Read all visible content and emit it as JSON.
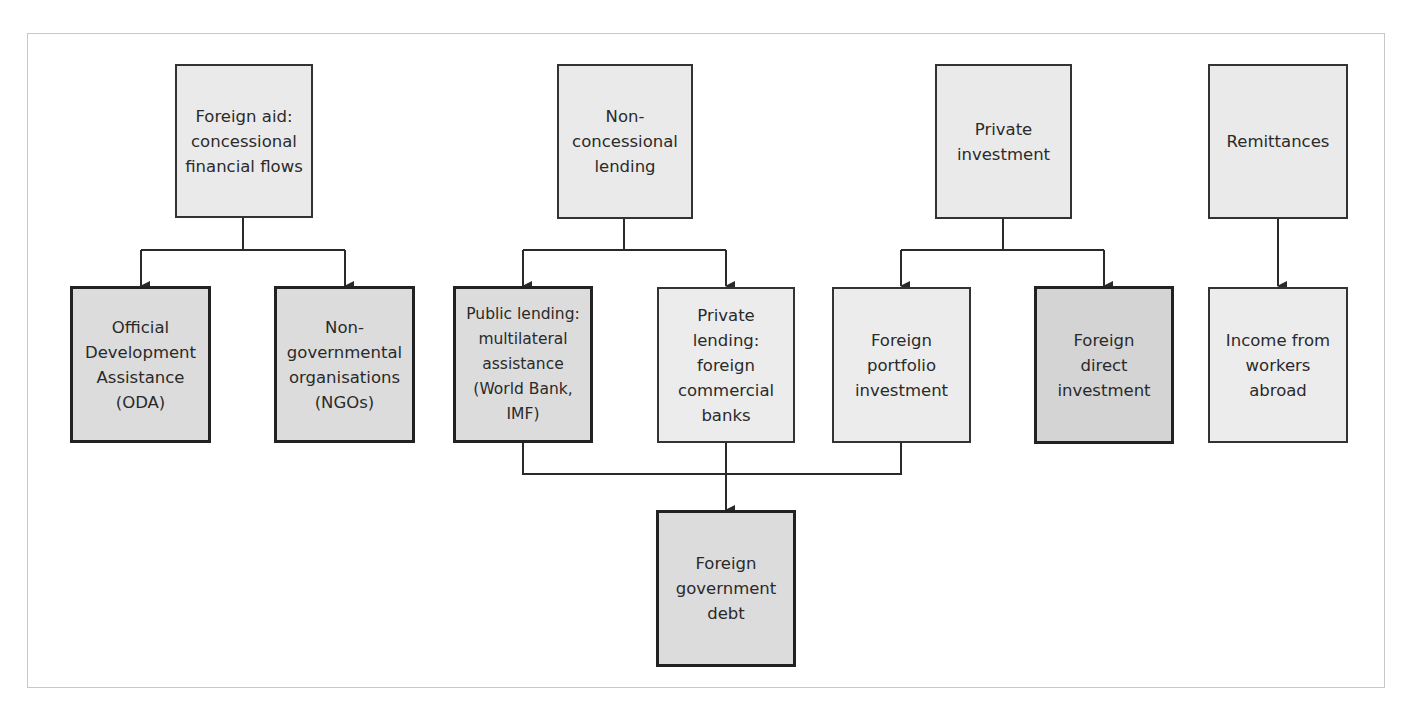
{
  "diagram": {
    "type": "flowchart",
    "top_nodes": [
      {
        "id": "foreign-aid",
        "label": "Foreign aid: concessional financial flows",
        "lines": [
          "Foreign aid:",
          "concessional",
          "financial flows"
        ]
      },
      {
        "id": "non-concessional",
        "label": "Non-concessional lending",
        "lines": [
          "Non-",
          "concessional",
          "lending"
        ]
      },
      {
        "id": "private-investment",
        "label": "Private investment",
        "lines": [
          "Private",
          "investment"
        ]
      },
      {
        "id": "remittances",
        "label": "Remittances",
        "lines": [
          "Remittances"
        ]
      }
    ],
    "middle_nodes": [
      {
        "id": "oda",
        "label": "Official Development Assistance (ODA)",
        "lines": [
          "Official",
          "Development",
          "Assistance",
          "(ODA)"
        ],
        "style": "medium",
        "parent": "foreign-aid"
      },
      {
        "id": "ngos",
        "label": "Non-governmental organisations (NGOs)",
        "lines": [
          "Non-",
          "governmental",
          "organisations",
          "(NGOs)"
        ],
        "style": "medium",
        "parent": "foreign-aid"
      },
      {
        "id": "public-lending",
        "label": "Public lending: multilateral assistance (World Bank, IMF)",
        "lines": [
          "Public lending:",
          "multilateral",
          "assistance",
          "(World Bank,",
          "IMF)"
        ],
        "style": "medium",
        "parent": "non-concessional"
      },
      {
        "id": "private-lending",
        "label": "Private lending: foreign commercial banks",
        "lines": [
          "Private",
          "lending:",
          "foreign",
          "commercial",
          "banks"
        ],
        "style": "light",
        "parent": "non-concessional"
      },
      {
        "id": "portfolio",
        "label": "Foreign portfolio investment",
        "lines": [
          "Foreign",
          "portfolio",
          "investment"
        ],
        "style": "light",
        "parent": "private-investment"
      },
      {
        "id": "fdi",
        "label": "Foreign direct investment",
        "lines": [
          "Foreign",
          "direct",
          "investment"
        ],
        "style": "dark",
        "parent": "private-investment"
      },
      {
        "id": "income-workers",
        "label": "Income from workers abroad",
        "lines": [
          "Income from",
          "workers",
          "abroad"
        ],
        "style": "light",
        "parent": "remittances"
      }
    ],
    "bottom_nodes": [
      {
        "id": "gov-debt",
        "label": "Foreign government debt",
        "lines": [
          "Foreign",
          "government",
          "debt"
        ],
        "style": "medium",
        "parents": [
          "public-lending",
          "private-lending",
          "portfolio"
        ]
      }
    ],
    "colors": {
      "line": "#2a2a2a",
      "top_fill": "#eaeaea",
      "light_fill": "#ececec",
      "medium_fill": "#dcdcdc",
      "dark_fill": "#d4d4d4",
      "frame": "#c8c8c8"
    }
  }
}
